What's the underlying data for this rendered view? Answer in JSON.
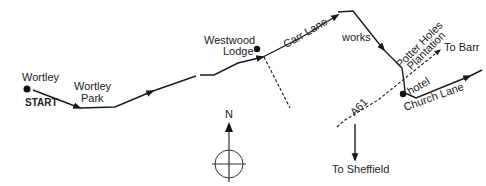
{
  "map": {
    "labels": {
      "wortley": "Wortley",
      "start": "START",
      "wortley_park_1": "Wortley",
      "wortley_park_2": "Park",
      "westwood_1": "Westwood",
      "westwood_2": "Lodge",
      "carr_lane": "Carr Lane",
      "works": "works",
      "potter_1": "Potter Holes",
      "potter_2": "Plantation",
      "to_barnsley": "To Barr",
      "hotel": "hotel",
      "church_lane": "Church Lane",
      "a61": "A61",
      "to_sheffield": "To Sheffield",
      "north": "N"
    },
    "colors": {
      "line": "#1a1a1a",
      "background": "#ffffff"
    }
  }
}
